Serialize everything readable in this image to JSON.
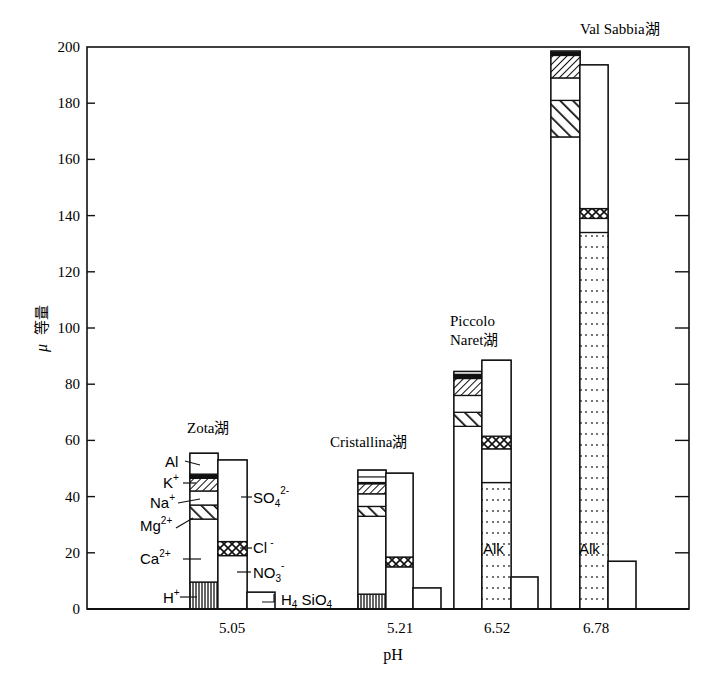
{
  "chart_data": {
    "type": "bar",
    "subtype": "stacked-ion-balance",
    "title": "",
    "xlabel": "pH",
    "ylabel": "μ 等量",
    "ylim": [
      0,
      200
    ],
    "yticks": [
      0,
      20,
      40,
      60,
      80,
      100,
      120,
      140,
      160,
      180,
      200
    ],
    "categories": [
      "5.05",
      "5.21",
      "6.52",
      "6.78"
    ],
    "grid": false,
    "groups": [
      {
        "lake": "Zota湖",
        "pH": "5.05",
        "cations": [
          {
            "ion": "H+",
            "from": 0,
            "to": 9.6,
            "pattern": "vertical"
          },
          {
            "ion": "Ca2+",
            "from": 9.6,
            "to": 32,
            "pattern": "none"
          },
          {
            "ion": "Mg2+",
            "from": 32,
            "to": 37,
            "pattern": "wide-backslash"
          },
          {
            "ion": "Na+",
            "from": 37,
            "to": 42,
            "pattern": "none"
          },
          {
            "ion": "K+",
            "from": 42,
            "to": 48,
            "pattern": "slash"
          },
          {
            "ion": "K+ (dark)",
            "from": 46.5,
            "to": 48,
            "pattern": "dark"
          },
          {
            "ion": "Al",
            "from": 48,
            "to": 55.4,
            "pattern": "none"
          }
        ],
        "anions": [
          {
            "ion": "NO3-",
            "from": 0,
            "to": 19,
            "pattern": "none"
          },
          {
            "ion": "Cl-",
            "from": 19,
            "to": 24,
            "pattern": "crosshatch"
          },
          {
            "ion": "SO42-",
            "from": 24,
            "to": 53,
            "pattern": "none"
          }
        ],
        "silicate": 6
      },
      {
        "lake": "Cristallina湖",
        "pH": "5.21",
        "cations": [
          {
            "ion": "H+",
            "from": 0,
            "to": 5.3,
            "pattern": "vertical"
          },
          {
            "ion": "Ca2+",
            "from": 5.3,
            "to": 33,
            "pattern": "none"
          },
          {
            "ion": "Mg2+",
            "from": 33,
            "to": 36.5,
            "pattern": "wide-backslash"
          },
          {
            "ion": "Na+",
            "from": 36.5,
            "to": 41,
            "pattern": "none"
          },
          {
            "ion": "K+",
            "from": 41,
            "to": 45,
            "pattern": "slash"
          },
          {
            "ion": "K+ (dark)",
            "from": 44.5,
            "to": 45,
            "pattern": "dark"
          },
          {
            "ion": "Al",
            "from": 45,
            "to": 49.4,
            "pattern": "none"
          },
          {
            "ion": "Al-line",
            "from": 47,
            "to": 47,
            "pattern": "none"
          }
        ],
        "anions": [
          {
            "ion": "NO3-",
            "from": 0,
            "to": 15,
            "pattern": "none"
          },
          {
            "ion": "Cl-",
            "from": 15,
            "to": 18.5,
            "pattern": "crosshatch"
          },
          {
            "ion": "SO42-",
            "from": 18.5,
            "to": 48.3,
            "pattern": "none"
          }
        ],
        "silicate": 7.5
      },
      {
        "lake": "Piccolo Naret湖",
        "pH": "6.52",
        "cations": [
          {
            "ion": "Ca2+",
            "from": 0,
            "to": 65,
            "pattern": "none"
          },
          {
            "ion": "Mg2+",
            "from": 65,
            "to": 70,
            "pattern": "wide-backslash"
          },
          {
            "ion": "Na+",
            "from": 70,
            "to": 76,
            "pattern": "none"
          },
          {
            "ion": "K+",
            "from": 76,
            "to": 83,
            "pattern": "slash"
          },
          {
            "ion": "K+ (dark)",
            "from": 82,
            "to": 83.5,
            "pattern": "dark"
          },
          {
            "ion": "Al",
            "from": 83.5,
            "to": 84.5,
            "pattern": "none"
          }
        ],
        "anions": [
          {
            "ion": "Alk",
            "from": 0,
            "to": 45,
            "pattern": "dots"
          },
          {
            "ion": "NO3-",
            "from": 45,
            "to": 57,
            "pattern": "none"
          },
          {
            "ion": "Cl-",
            "from": 57,
            "to": 61.5,
            "pattern": "crosshatch"
          },
          {
            "ion": "SO42-",
            "from": 61.5,
            "to": 88.5,
            "pattern": "none"
          }
        ],
        "silicate": 11.4
      },
      {
        "lake": "Val Sabbia湖",
        "pH": "6.78",
        "cations": [
          {
            "ion": "Ca2+",
            "from": 0,
            "to": 168,
            "pattern": "none"
          },
          {
            "ion": "Mg2+",
            "from": 168,
            "to": 181,
            "pattern": "wide-backslash"
          },
          {
            "ion": "Na+",
            "from": 181,
            "to": 189,
            "pattern": "none"
          },
          {
            "ion": "K+",
            "from": 189,
            "to": 197,
            "pattern": "slash"
          },
          {
            "ion": "K+ (dark)",
            "from": 197,
            "to": 198,
            "pattern": "dark"
          },
          {
            "ion": "Al",
            "from": 198,
            "to": 198.5,
            "pattern": "none"
          }
        ],
        "anions": [
          {
            "ion": "Alk",
            "from": 0,
            "to": 134,
            "pattern": "dots"
          },
          {
            "ion": "NO3-",
            "from": 134,
            "to": 139,
            "pattern": "none"
          },
          {
            "ion": "Cl-",
            "from": 139,
            "to": 142.5,
            "pattern": "crosshatch"
          },
          {
            "ion": "SO42-",
            "from": 142.5,
            "to": 193.6,
            "pattern": "none"
          }
        ],
        "silicate": 17
      }
    ],
    "annotations": [
      "Al",
      "K+",
      "Na+",
      "Mg2+",
      "Ca2+",
      "H+",
      "SO42-",
      "Cl-",
      "NO3-",
      "H4SiO4",
      "Alk",
      "Alk"
    ]
  },
  "labels": {
    "ylabel_mu": "μ",
    "ylabel_unit": "等量",
    "xlabel": "pH",
    "lakes": {
      "zota": "Zota湖",
      "cristallina": "Cristallina湖",
      "piccolo_1": "Piccolo",
      "piccolo_2": "Naret湖",
      "valsabbia": "Val Sabbia湖"
    },
    "ions": {
      "al": "Al",
      "k": "K",
      "na": "Na",
      "mg": "Mg",
      "ca": "Ca",
      "h": "H",
      "so4": "SO",
      "cl": "Cl",
      "no3": "NO",
      "h4sio4": "H",
      "alk": "Alk"
    }
  }
}
